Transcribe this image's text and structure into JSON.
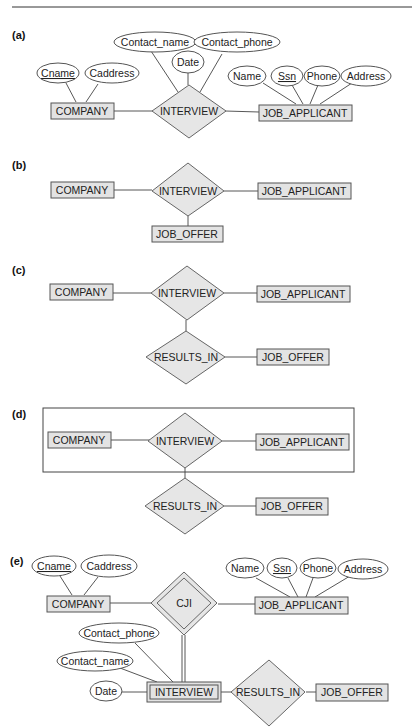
{
  "figure": {
    "top_rule": true,
    "panels": {
      "a": {
        "label": "(a)",
        "entities": {
          "company": "COMPANY",
          "job_applicant": "JOB_APPLICANT"
        },
        "relationship": "INTERVIEW",
        "company_attributes": {
          "cname": "Cname",
          "caddress": "Caddress"
        },
        "interview_attributes": {
          "contact_name": "Contact_name",
          "contact_phone": "Contact_phone",
          "date": "Date"
        },
        "applicant_attributes": {
          "name": "Name",
          "ssn": "Ssn",
          "phone": "Phone",
          "address": "Address"
        }
      },
      "b": {
        "label": "(b)",
        "entities": {
          "company": "COMPANY",
          "job_applicant": "JOB_APPLICANT",
          "job_offer": "JOB_OFFER"
        },
        "relationship": "INTERVIEW"
      },
      "c": {
        "label": "(c)",
        "entities": {
          "company": "COMPANY",
          "job_applicant": "JOB_APPLICANT",
          "job_offer": "JOB_OFFER"
        },
        "relationships": {
          "interview": "INTERVIEW",
          "results_in": "RESULTS_IN"
        }
      },
      "d": {
        "label": "(d)",
        "entities": {
          "company": "COMPANY",
          "job_applicant": "JOB_APPLICANT",
          "job_offer": "JOB_OFFER"
        },
        "relationships": {
          "interview": "INTERVIEW",
          "results_in": "RESULTS_IN"
        }
      },
      "e": {
        "label": "(e)",
        "entities": {
          "company": "COMPANY",
          "job_applicant": "JOB_APPLICANT",
          "job_offer": "JOB_OFFER",
          "interview_weak": "INTERVIEW"
        },
        "relationships": {
          "cji": "CJI",
          "results_in": "RESULTS_IN"
        },
        "company_attributes": {
          "cname": "Cname",
          "caddress": "Caddress"
        },
        "applicant_attributes": {
          "name": "Name",
          "ssn": "Ssn",
          "phone": "Phone",
          "address": "Address"
        },
        "interview_attributes": {
          "contact_phone": "Contact_phone",
          "contact_name": "Contact_name",
          "date": "Date"
        }
      }
    }
  }
}
